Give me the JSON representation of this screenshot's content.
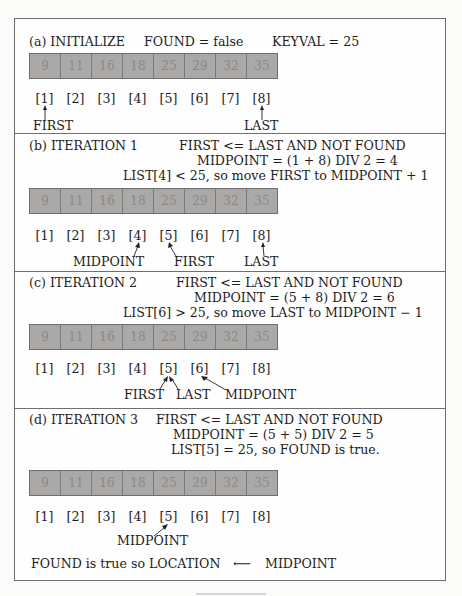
{
  "figure": {
    "array_values": [
      "9",
      "11",
      "16",
      "18",
      "25",
      "29",
      "32",
      "35"
    ],
    "indices": [
      "[1]",
      "[2]",
      "[3]",
      "[4]",
      "[5]",
      "[6]",
      "[7]",
      "[8]"
    ],
    "colors": {
      "cell_fill": "#aaa9a7",
      "cell_border": "#6e6e6e",
      "cell_text": "#8a8886",
      "frame": "#6f6f6f"
    },
    "sections": [
      {
        "id": "a",
        "header": "(a) INITIALIZE",
        "lines": [
          "FOUND = false",
          "KEYVAL = 25"
        ],
        "pointers": [
          {
            "label": "FIRST",
            "index": 1
          },
          {
            "label": "LAST",
            "index": 8
          }
        ]
      },
      {
        "id": "b",
        "header": "(b) ITERATION 1",
        "lines": [
          "FIRST <= LAST AND NOT FOUND",
          "MIDPOINT = (1 + 8) DIV 2 = 4",
          "LIST[4] < 25, so move FIRST to MIDPOINT + 1"
        ],
        "pointers": [
          {
            "label": "MIDPOINT",
            "index": 4
          },
          {
            "label": "FIRST",
            "index": 5
          },
          {
            "label": "LAST",
            "index": 8
          }
        ]
      },
      {
        "id": "c",
        "header": "(c) ITERATION 2",
        "lines": [
          "FIRST <= LAST AND NOT FOUND",
          "MIDPOINT = (5 + 8) DIV 2 = 6",
          "LIST[6] > 25, so move LAST to MIDPOINT − 1"
        ],
        "pointers": [
          {
            "label": "FIRST",
            "index": 5
          },
          {
            "label": "LAST",
            "index": 5
          },
          {
            "label": "MIDPOINT",
            "index": 6
          }
        ]
      },
      {
        "id": "d",
        "header": "(d) ITERATION 3",
        "lines": [
          "FIRST <= LAST AND NOT FOUND",
          "MIDPOINT = (5 + 5) DIV 2 = 5",
          "LIST[5] = 25, so FOUND is true."
        ],
        "pointers": [
          {
            "label": "MIDPOINT",
            "index": 5
          }
        ],
        "conclusion": {
          "left": "FOUND is true so LOCATION",
          "arrow": "⟵",
          "right": "MIDPOINT"
        }
      }
    ]
  }
}
